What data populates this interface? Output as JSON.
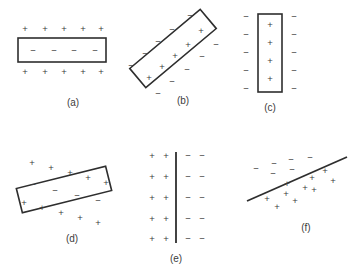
{
  "figure": {
    "width": 356,
    "height": 272,
    "background_color": "#ffffff",
    "stroke_color": "#2e2e2e",
    "charge_color": "#3a3a3a",
    "plus_symbol": "+",
    "minus_symbol": "−"
  },
  "panels": [
    {
      "id": "a",
      "label": "(a)",
      "label_x": 73,
      "label_y": 103,
      "shape": "horizontal-rectangle",
      "rect": {
        "x": 18,
        "y": 38,
        "width": 88,
        "height": 24,
        "rotation": 0
      },
      "charges_outside_top": [
        {
          "sign": "+",
          "x": 25,
          "y": 29
        },
        {
          "sign": "+",
          "x": 45,
          "y": 29
        },
        {
          "sign": "+",
          "x": 64,
          "y": 29
        },
        {
          "sign": "+",
          "x": 83,
          "y": 29
        },
        {
          "sign": "+",
          "x": 101,
          "y": 29
        }
      ],
      "charges_inside": [
        {
          "sign": "−",
          "x": 33,
          "y": 51
        },
        {
          "sign": "−",
          "x": 54,
          "y": 51
        },
        {
          "sign": "−",
          "x": 74,
          "y": 51
        },
        {
          "sign": "−",
          "x": 95,
          "y": 51
        }
      ],
      "charges_outside_bottom": [
        {
          "sign": "+",
          "x": 25,
          "y": 72
        },
        {
          "sign": "+",
          "x": 45,
          "y": 72
        },
        {
          "sign": "+",
          "x": 64,
          "y": 72
        },
        {
          "sign": "+",
          "x": 83,
          "y": 72
        },
        {
          "sign": "+",
          "x": 101,
          "y": 72
        }
      ]
    },
    {
      "id": "b",
      "label": "(b)",
      "label_x": 183,
      "label_y": 101,
      "shape": "tilted-rectangle",
      "rect": {
        "x": 127,
        "y": 36,
        "width": 92,
        "height": 25,
        "rotation": -40
      },
      "charges_inside": [
        {
          "sign": "+",
          "x": 149,
          "y": 78
        },
        {
          "sign": "+",
          "x": 162,
          "y": 67
        },
        {
          "sign": "+",
          "x": 175,
          "y": 56
        },
        {
          "sign": "+",
          "x": 188,
          "y": 45
        },
        {
          "sign": "+",
          "x": 201,
          "y": 31
        }
      ],
      "charges_outside_upper": [
        {
          "sign": "−",
          "x": 131,
          "y": 66
        },
        {
          "sign": "−",
          "x": 145,
          "y": 54
        },
        {
          "sign": "−",
          "x": 158,
          "y": 42
        },
        {
          "sign": "−",
          "x": 172,
          "y": 30
        },
        {
          "sign": "−",
          "x": 190,
          "y": 16
        }
      ],
      "charges_outside_lower": [
        {
          "sign": "−",
          "x": 158,
          "y": 94
        },
        {
          "sign": "−",
          "x": 172,
          "y": 82
        },
        {
          "sign": "−",
          "x": 187,
          "y": 70
        },
        {
          "sign": "−",
          "x": 202,
          "y": 57
        },
        {
          "sign": "−",
          "x": 216,
          "y": 45
        }
      ]
    },
    {
      "id": "c",
      "label": "(c)",
      "label_x": 270,
      "label_y": 108,
      "shape": "vertical-rectangle",
      "rect": {
        "x": 258,
        "y": 14,
        "width": 24,
        "height": 78,
        "rotation": 0
      },
      "charges_inside": [
        {
          "sign": "+",
          "x": 270,
          "y": 25
        },
        {
          "sign": "+",
          "x": 270,
          "y": 43
        },
        {
          "sign": "+",
          "x": 270,
          "y": 61
        },
        {
          "sign": "+",
          "x": 270,
          "y": 79
        }
      ],
      "charges_outside_left": [
        {
          "sign": "−",
          "x": 246,
          "y": 17
        },
        {
          "sign": "−",
          "x": 246,
          "y": 35
        },
        {
          "sign": "−",
          "x": 246,
          "y": 53
        },
        {
          "sign": "−",
          "x": 246,
          "y": 71
        },
        {
          "sign": "−",
          "x": 246,
          "y": 89
        }
      ],
      "charges_outside_right": [
        {
          "sign": "−",
          "x": 294,
          "y": 17
        },
        {
          "sign": "−",
          "x": 294,
          "y": 35
        },
        {
          "sign": "−",
          "x": 294,
          "y": 53
        },
        {
          "sign": "−",
          "x": 294,
          "y": 71
        },
        {
          "sign": "−",
          "x": 294,
          "y": 89
        }
      ]
    },
    {
      "id": "d",
      "label": "(d)",
      "label_x": 72,
      "label_y": 239,
      "shape": "tilted-rectangle",
      "rect": {
        "x": 18,
        "y": 177,
        "width": 92,
        "height": 25,
        "rotation": -14
      },
      "charges_outside_top": [
        {
          "sign": "+",
          "x": 32,
          "y": 163
        },
        {
          "sign": "+",
          "x": 51,
          "y": 168
        },
        {
          "sign": "+",
          "x": 70,
          "y": 173
        },
        {
          "sign": "+",
          "x": 88,
          "y": 178
        },
        {
          "sign": "+",
          "x": 106,
          "y": 183
        }
      ],
      "charges_inside": [
        {
          "sign": "−",
          "x": 33,
          "y": 185
        },
        {
          "sign": "−",
          "x": 55,
          "y": 191
        },
        {
          "sign": "−",
          "x": 77,
          "y": 196
        },
        {
          "sign": "−",
          "x": 98,
          "y": 201
        }
      ],
      "charges_outside_bottom": [
        {
          "sign": "+",
          "x": 24,
          "y": 203
        },
        {
          "sign": "+",
          "x": 42,
          "y": 208
        },
        {
          "sign": "+",
          "x": 61,
          "y": 213
        },
        {
          "sign": "+",
          "x": 80,
          "y": 218
        },
        {
          "sign": "+",
          "x": 98,
          "y": 223
        }
      ]
    },
    {
      "id": "e",
      "label": "(e)",
      "label_x": 176,
      "label_y": 259,
      "shape": "vertical-sheet-line",
      "line": {
        "x1": 176,
        "y1": 152,
        "x2": 176,
        "y2": 243
      },
      "charges_left": [
        {
          "sign": "+",
          "x": 152,
          "y": 156
        },
        {
          "sign": "+",
          "x": 166,
          "y": 156
        },
        {
          "sign": "+",
          "x": 152,
          "y": 177
        },
        {
          "sign": "+",
          "x": 166,
          "y": 177
        },
        {
          "sign": "+",
          "x": 152,
          "y": 198
        },
        {
          "sign": "+",
          "x": 166,
          "y": 198
        },
        {
          "sign": "+",
          "x": 152,
          "y": 219
        },
        {
          "sign": "+",
          "x": 166,
          "y": 219
        },
        {
          "sign": "+",
          "x": 152,
          "y": 239
        },
        {
          "sign": "+",
          "x": 166,
          "y": 239
        }
      ],
      "charges_right": [
        {
          "sign": "−",
          "x": 188,
          "y": 156
        },
        {
          "sign": "−",
          "x": 202,
          "y": 156
        },
        {
          "sign": "−",
          "x": 188,
          "y": 177
        },
        {
          "sign": "−",
          "x": 202,
          "y": 177
        },
        {
          "sign": "−",
          "x": 188,
          "y": 198
        },
        {
          "sign": "−",
          "x": 202,
          "y": 198
        },
        {
          "sign": "−",
          "x": 188,
          "y": 219
        },
        {
          "sign": "−",
          "x": 202,
          "y": 219
        },
        {
          "sign": "−",
          "x": 188,
          "y": 239
        },
        {
          "sign": "−",
          "x": 202,
          "y": 239
        }
      ]
    },
    {
      "id": "f",
      "label": "(f)",
      "label_x": 306,
      "label_y": 228,
      "shape": "diagonal-sheet-line",
      "line": {
        "x1": 247,
        "y1": 201,
        "x2": 347,
        "y2": 157
      },
      "charges_above": [
        {
          "sign": "−",
          "x": 256,
          "y": 169
        },
        {
          "sign": "−",
          "x": 274,
          "y": 164
        },
        {
          "sign": "−",
          "x": 273,
          "y": 174
        },
        {
          "sign": "−",
          "x": 291,
          "y": 160
        },
        {
          "sign": "−",
          "x": 292,
          "y": 170
        },
        {
          "sign": "−",
          "x": 310,
          "y": 158
        }
      ],
      "charges_below": [
        {
          "sign": "+",
          "x": 267,
          "y": 199
        },
        {
          "sign": "+",
          "x": 277,
          "y": 207
        },
        {
          "sign": "+",
          "x": 286,
          "y": 194
        },
        {
          "sign": "+",
          "x": 295,
          "y": 201
        },
        {
          "sign": "+",
          "x": 287,
          "y": 184
        },
        {
          "sign": "+",
          "x": 305,
          "y": 188
        },
        {
          "sign": "+",
          "x": 312,
          "y": 178
        },
        {
          "sign": "+",
          "x": 314,
          "y": 190
        },
        {
          "sign": "+",
          "x": 325,
          "y": 171
        },
        {
          "sign": "+",
          "x": 333,
          "y": 181
        }
      ]
    }
  ]
}
